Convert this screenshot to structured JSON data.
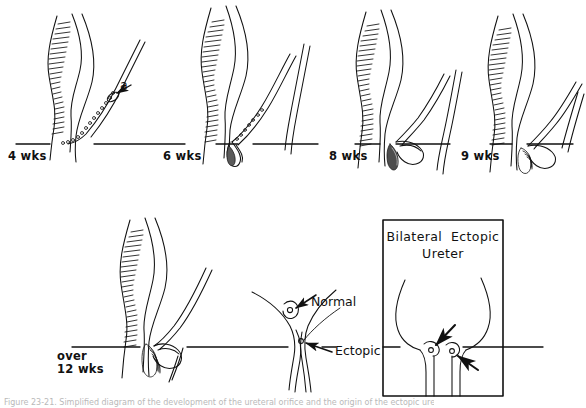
{
  "figure": {
    "type": "anatomical-line-diagram",
    "background_color": "#ffffff",
    "ink_color": "#111111",
    "caption_text": "Figure 23-21. Simplified diagram of the development of the ureteral orifice and the origin of the ectopic ureter.",
    "rows": [
      {
        "row": "top",
        "baseline_y": 144,
        "panels": [
          {
            "id": "wk4",
            "label": "4 wks",
            "label_x": 8,
            "label_y": 150
          },
          {
            "id": "wk6",
            "label": "6 wks",
            "label_x": 163,
            "label_y": 150
          },
          {
            "id": "wk8",
            "label": "8 wks",
            "label_x": 329,
            "label_y": 150
          },
          {
            "id": "wk9",
            "label": "9 wks",
            "label_x": 461,
            "label_y": 150
          }
        ]
      },
      {
        "row": "bottom",
        "baseline_y": 347,
        "panels": [
          {
            "id": "wk12",
            "label": "over\n12 wks",
            "label_x": 57,
            "label_y": 350
          },
          {
            "id": "detail",
            "label": "",
            "label_x": 0,
            "label_y": 0
          },
          {
            "id": "boxed",
            "label": "",
            "label_x": 0,
            "label_y": 0
          }
        ]
      }
    ],
    "annotations": [
      {
        "id": "bud-a",
        "text": "a",
        "x": 120,
        "y": 84,
        "arrow": "points-left",
        "panel": "wk4"
      },
      {
        "id": "normal",
        "text": "Normal",
        "x": 311,
        "y": 301,
        "arrow": "points-down-left",
        "panel": "detail"
      },
      {
        "id": "ectopic",
        "text": "Ectopic",
        "x": 335,
        "y": 350,
        "arrow": "points-up-left",
        "panel": "detail"
      }
    ],
    "boxed_panel": {
      "id": "bilateral-ectopic-ureter",
      "title_line1": "Bilateral  Ectopic",
      "title_line2": "Ureter",
      "box": {
        "x": 383,
        "y": 220,
        "width": 120,
        "height": 176
      },
      "arrow_count": 2
    }
  }
}
